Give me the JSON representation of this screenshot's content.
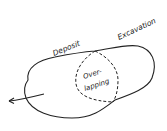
{
  "diagram": {
    "labels": {
      "deposit": "Deposit",
      "excavation": "Excavation",
      "overlap_line1": "Over-",
      "overlap_line2": "lapping"
    },
    "colors": {
      "stroke": "#222222",
      "background": "#ffffff"
    },
    "regions": [
      {
        "name": "deposit",
        "style": "solid-outline"
      },
      {
        "name": "excavation",
        "style": "solid-outline"
      },
      {
        "name": "overlapping",
        "style": "dashed-outline"
      }
    ],
    "arrow": {
      "direction": "left",
      "icon": "arrow-left-icon"
    }
  }
}
